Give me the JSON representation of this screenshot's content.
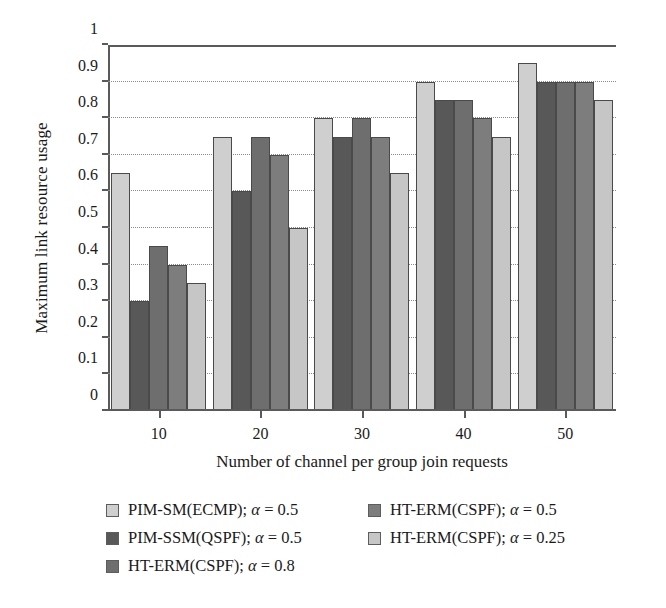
{
  "chart_data": {
    "type": "bar",
    "title": "",
    "xlabel": "Number of channel per group join requests",
    "ylabel": "Maximum link resource usage",
    "categories": [
      "10",
      "20",
      "30",
      "40",
      "50"
    ],
    "ylim": [
      0,
      1
    ],
    "yticks": [
      "0",
      "0.1",
      "0.2",
      "0.3",
      "0.4",
      "0.5",
      "0.6",
      "0.7",
      "0.8",
      "0.9",
      "1"
    ],
    "grid": true,
    "legend_position": "below",
    "series": [
      {
        "name": "PIM-SM(ECMP); α = 0.5",
        "color": "#cfcfcf",
        "values": [
          0.65,
          0.75,
          0.8,
          0.9,
          0.95
        ]
      },
      {
        "name": "PIM-SSM(QSPF); α = 0.5",
        "color": "#585858",
        "values": [
          0.3,
          0.6,
          0.75,
          0.85,
          0.9
        ]
      },
      {
        "name": "HT-ERM(CSPF); α = 0.8",
        "color": "#6e6e6e",
        "values": [
          0.45,
          0.75,
          0.8,
          0.85,
          0.9
        ]
      },
      {
        "name": "HT-ERM(CSPF); α = 0.5",
        "color": "#7d7d7d",
        "values": [
          0.4,
          0.7,
          0.75,
          0.8,
          0.9
        ]
      },
      {
        "name": "HT-ERM(CSPF); α = 0.25",
        "color": "#c6c6c6",
        "values": [
          0.35,
          0.5,
          0.65,
          0.75,
          0.85
        ]
      }
    ]
  },
  "legend": {
    "left_column": [
      {
        "label": "PIM-SM(ECMP); α = 0.5",
        "color": "#cfcfcf"
      },
      {
        "label": "PIM-SSM(QSPF); α = 0.5",
        "color": "#585858"
      },
      {
        "label": "HT-ERM(CSPF); α = 0.8",
        "color": "#6e6e6e"
      }
    ],
    "right_column": [
      {
        "label": "HT-ERM(CSPF); α = 0.5",
        "color": "#7d7d7d"
      },
      {
        "label": "HT-ERM(CSPF); α = 0.25",
        "color": "#c6c6c6"
      }
    ]
  }
}
